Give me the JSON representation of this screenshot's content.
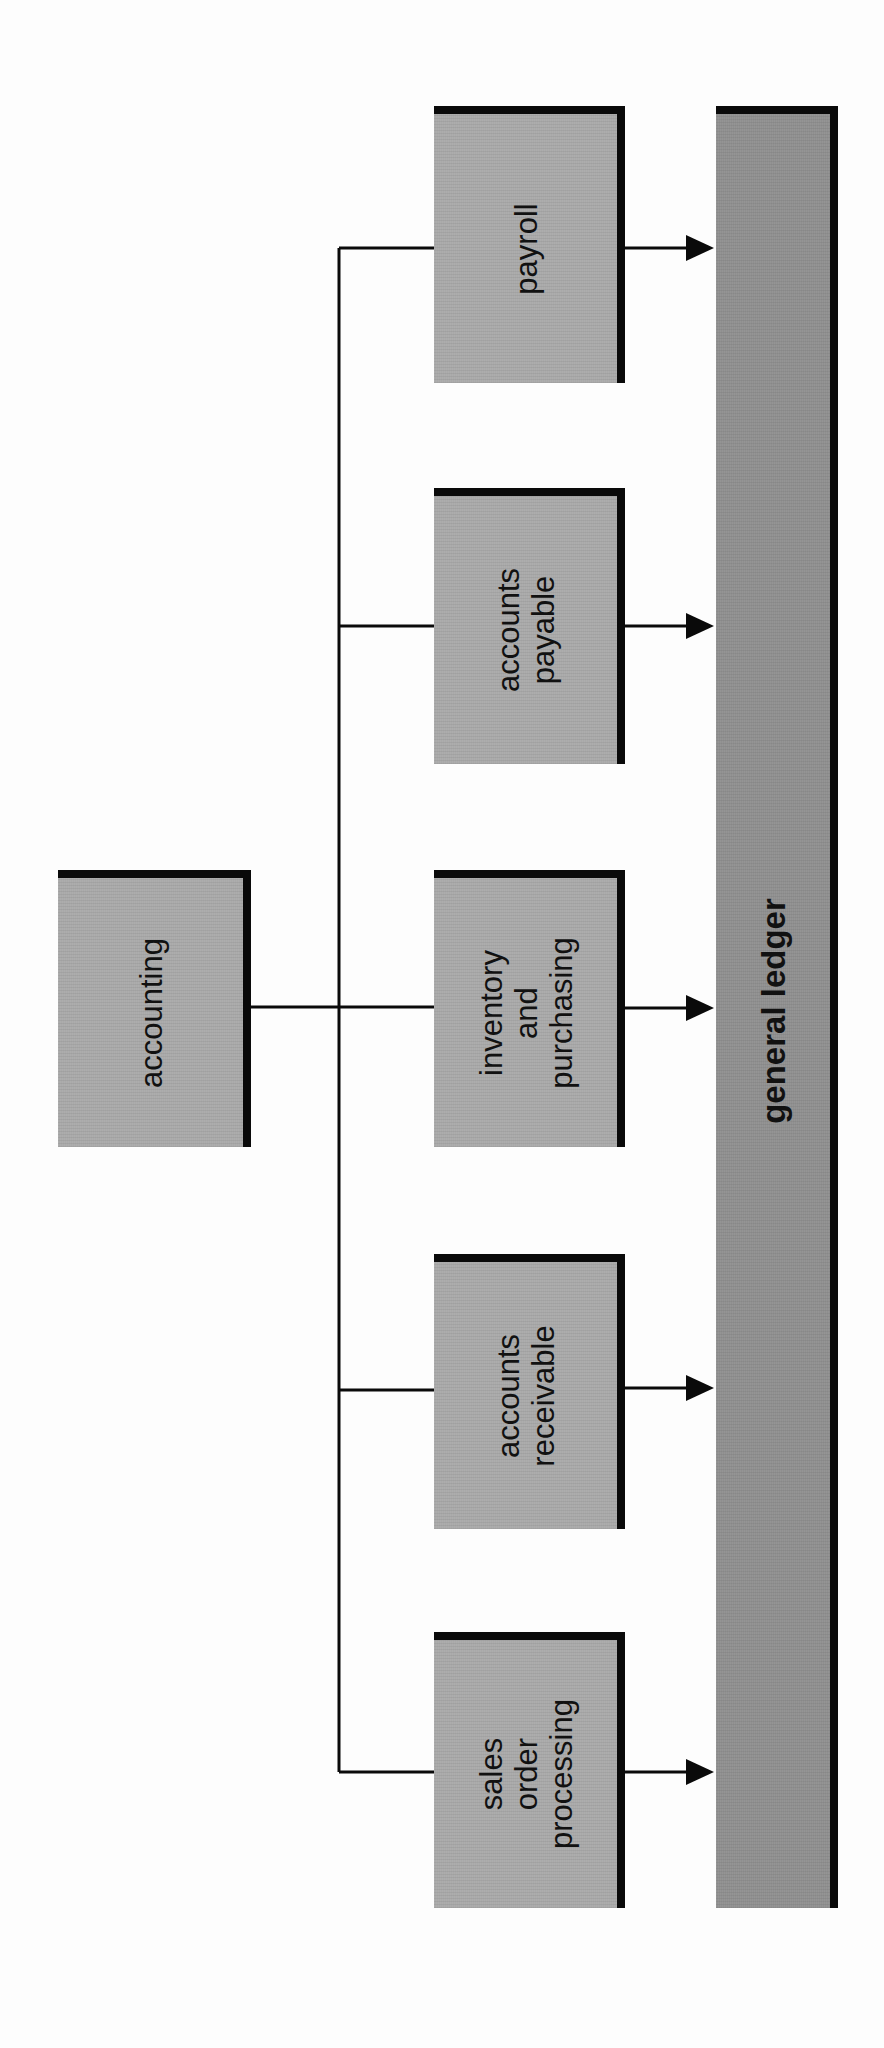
{
  "diagram": {
    "orientation": "rotated-90-ccw",
    "root": {
      "label": "accounting"
    },
    "subsystems": [
      {
        "label": "payroll"
      },
      {
        "label": "accounts\npayable"
      },
      {
        "label": "inventory\nand\npurchasing"
      },
      {
        "label": "accounts\nreceivable"
      },
      {
        "label": "sales\norder\nprocessing"
      }
    ],
    "target": {
      "label": "general ledger"
    },
    "colors": {
      "box_fill": "#a9a9a9",
      "ledger_fill": "#8f8f8f",
      "border": "#0a0a0a",
      "line": "#0a0a0a",
      "background": "#fdfdfd"
    }
  }
}
